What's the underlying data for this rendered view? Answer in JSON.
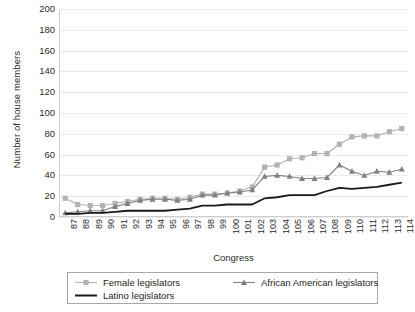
{
  "chart_data": {
    "type": "line",
    "title": "",
    "xlabel": "Congress",
    "ylabel": "Number of house members",
    "ylim": [
      0,
      200
    ],
    "ytick_step": 20,
    "yticks": [
      200,
      180,
      160,
      140,
      120,
      100,
      80,
      60,
      40,
      20,
      0
    ],
    "grid": true,
    "legend_position": "bottom",
    "categories": [
      "87",
      "88",
      "89",
      "90",
      "91",
      "92",
      "93",
      "94",
      "95",
      "96",
      "97",
      "98",
      "99",
      "100",
      "101",
      "102",
      "103",
      "104",
      "105",
      "106",
      "107",
      "108",
      "109",
      "110",
      "111",
      "112",
      "113",
      "114"
    ],
    "series": [
      {
        "name": "Female legislators",
        "marker": "square",
        "color": "#b3b3b3",
        "values": [
          18,
          12,
          11,
          11,
          13,
          15,
          17,
          18,
          18,
          17,
          19,
          22,
          22,
          23,
          25,
          29,
          48,
          50,
          56,
          57,
          61,
          61,
          70,
          77,
          78,
          78,
          82,
          85
        ]
      },
      {
        "name": "African American legislators",
        "marker": "triangle",
        "color": "#808080",
        "values": [
          4,
          5,
          6,
          6,
          10,
          13,
          16,
          17,
          17,
          16,
          17,
          21,
          21,
          23,
          24,
          26,
          39,
          40,
          39,
          37,
          37,
          38,
          50,
          44,
          40,
          44,
          43,
          46
        ]
      },
      {
        "name": "Latino legislators",
        "marker": "none",
        "color": "#1a1a1a",
        "values": [
          3,
          3,
          4,
          4,
          5,
          6,
          6,
          6,
          6,
          7,
          8,
          11,
          11,
          12,
          12,
          12,
          18,
          19,
          21,
          21,
          21,
          25,
          28,
          27,
          28,
          29,
          31,
          33
        ]
      }
    ]
  },
  "legend": {
    "items": [
      {
        "label": "Female legislators"
      },
      {
        "label": "African American legislators"
      },
      {
        "label": "Latino legislators"
      }
    ]
  },
  "colors": {
    "female": "#b3b3b3",
    "african_american": "#808080",
    "latino": "#1a1a1a",
    "grid": "#eceaea",
    "text": "#231f20"
  }
}
